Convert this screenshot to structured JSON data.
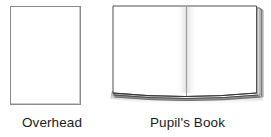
{
  "page": {
    "background_color": "#ffffff",
    "width": 271,
    "height": 137
  },
  "figures": [
    {
      "id": "overhead",
      "caption": "Overhead",
      "icon_name": "overhead-transparency-sheet-icon",
      "shape": "portrait-rectangle",
      "fill_color": "#ffffff",
      "outline_color": "#8a8a8a"
    },
    {
      "id": "pupils-book",
      "caption": "Pupil's Book",
      "icon_name": "open-book-icon",
      "shape": "open-book-two-pages",
      "fill_color": "#ffffff",
      "outline_color": "#4a4a4a",
      "page_stack_color": "#2b2b2b",
      "shadow_color": "#9a9a9a"
    }
  ]
}
